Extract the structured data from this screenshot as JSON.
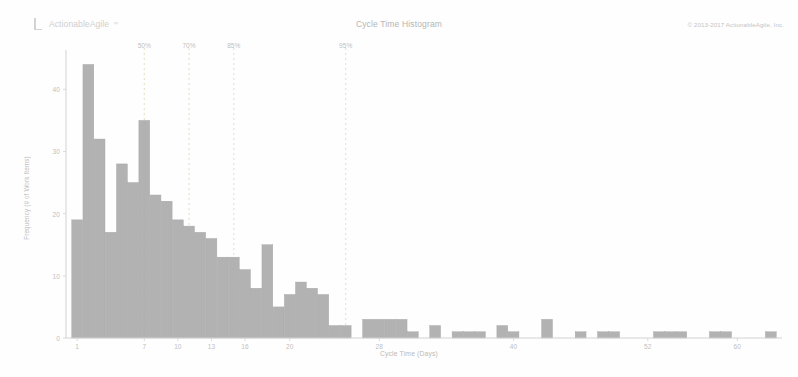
{
  "app": {
    "brand_name": "ActionableAgile",
    "brand_tm": "™",
    "brand_icon": "bracket-logo-icon",
    "copyright": "© 2013-2017 ActionableAgile, Inc."
  },
  "colors": {
    "bar_fill": "#a8a8a8",
    "bar_stroke": "#9a9a9a",
    "axis": "#d2d2d2",
    "percentile_line": "#dcd6b4",
    "text": "#bdbdbd",
    "background": "#ffffff"
  },
  "chart_data": {
    "type": "bar",
    "title": "Cycle Time Histogram",
    "xlabel": "Cycle Time (Days)",
    "ylabel": "Frequency (# of Work Items)",
    "xlim": [
      0,
      64
    ],
    "ylim": [
      0,
      46
    ],
    "grid": false,
    "legend": "none",
    "ytick_labels": [
      "0",
      "10",
      "20",
      "30",
      "40"
    ],
    "ytick_values": [
      0,
      10,
      20,
      30,
      40
    ],
    "xtick_labels": [
      "1",
      "7",
      "10",
      "13",
      "16",
      "20",
      "28",
      "40",
      "52",
      "60"
    ],
    "xtick_values": [
      1,
      7,
      10,
      13,
      16,
      20,
      28,
      40,
      52,
      60
    ],
    "categories": [
      1,
      2,
      3,
      4,
      5,
      6,
      7,
      8,
      9,
      10,
      11,
      12,
      13,
      14,
      15,
      16,
      17,
      18,
      19,
      20,
      21,
      22,
      23,
      24,
      25,
      26,
      27,
      28,
      29,
      30,
      31,
      32,
      33,
      34,
      35,
      36,
      37,
      38,
      39,
      40,
      41,
      42,
      43,
      44,
      45,
      46,
      47,
      48,
      49,
      50,
      51,
      52,
      53,
      54,
      55,
      56,
      57,
      58,
      59,
      60,
      61,
      62,
      63
    ],
    "values": [
      19,
      44,
      32,
      17,
      28,
      25,
      35,
      23,
      22,
      19,
      18,
      17,
      16,
      13,
      13,
      11,
      8,
      15,
      5,
      7,
      9,
      8,
      7,
      2,
      2,
      0,
      3,
      3,
      3,
      3,
      1,
      0,
      2,
      0,
      1,
      1,
      1,
      0,
      2,
      1,
      0,
      0,
      3,
      0,
      0,
      1,
      0,
      1,
      1,
      0,
      0,
      0,
      1,
      1,
      1,
      0,
      0,
      1,
      1,
      0,
      0,
      0,
      1
    ],
    "percentiles": [
      {
        "label": "50%",
        "x": 7
      },
      {
        "label": "70%",
        "x": 11
      },
      {
        "label": "85%",
        "x": 15
      },
      {
        "label": "95%",
        "x": 25
      }
    ]
  }
}
